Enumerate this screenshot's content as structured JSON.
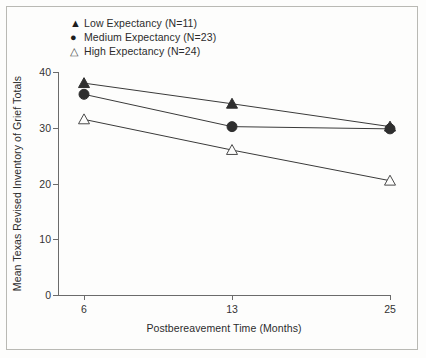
{
  "chart_data": {
    "type": "line",
    "title": "",
    "xlabel": "Postbereavement Time (Months)",
    "ylabel": "Mean Texas Revised Inventory of Grief Totals",
    "x": [
      6,
      13,
      25
    ],
    "xtick_labels": [
      "6",
      "13",
      "25"
    ],
    "ytick_labels": [
      "0",
      "10",
      "20",
      "30",
      "40"
    ],
    "yticks": [
      0,
      10,
      20,
      30,
      40
    ],
    "ylim": [
      0,
      40
    ],
    "grid": false,
    "legend_position": "top-left",
    "series": [
      {
        "name": "Low Expectancy (N=11)",
        "marker": "filled-triangle",
        "symbol": "▲",
        "n": 11,
        "values": [
          38.0,
          34.3,
          30.2
        ]
      },
      {
        "name": "Medium Expectancy (N=23)",
        "marker": "filled-circle",
        "symbol": "●",
        "n": 23,
        "values": [
          36.0,
          30.2,
          29.8
        ]
      },
      {
        "name": "High Expectancy (N=24)",
        "marker": "open-triangle",
        "symbol": "△",
        "n": 24,
        "values": [
          31.5,
          26.0,
          20.5
        ]
      }
    ]
  },
  "legend": {
    "items": [
      {
        "symbol": "▲",
        "label": "Low Expectancy (N=11)"
      },
      {
        "symbol": "●",
        "label": "Medium Expectancy (N=23)"
      },
      {
        "symbol": "△",
        "label": "High Expectancy (N=24)"
      }
    ]
  },
  "axes": {
    "x_title": "Postbereavement Time (Months)",
    "y_title": "Mean Texas Revised Inventory of Grief Totals",
    "x_tick_labels": [
      "6",
      "13",
      "25"
    ],
    "y_tick_labels": [
      "0",
      "10",
      "20",
      "30",
      "40"
    ]
  },
  "colors": {
    "line": "#3a3a3a",
    "axis": "#6b6b6b",
    "text": "#2c2c2c",
    "background": "#fdfdfc"
  }
}
